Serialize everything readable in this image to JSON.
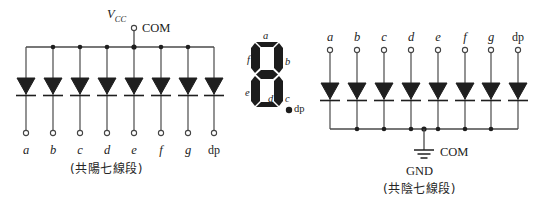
{
  "figure": {
    "background": "#ffffff",
    "ink_color": "#1c1c1c",
    "line_color": "#404040"
  },
  "common_anode_circuit": {
    "name": "common-anode-seven-segment",
    "supply_label": "V",
    "supply_subscript": "CC",
    "common_terminal_label": "COM",
    "caption": "(共陽七線段)",
    "terminals": [
      {
        "label": "a",
        "italic": true
      },
      {
        "label": "b",
        "italic": true
      },
      {
        "label": "c",
        "italic": true
      },
      {
        "label": "d",
        "italic": true
      },
      {
        "label": "e",
        "italic": true
      },
      {
        "label": "f",
        "italic": true
      },
      {
        "label": "g",
        "italic": true
      },
      {
        "label": "dp",
        "italic": false
      }
    ],
    "diode_count": 8,
    "diode_orientation": "cathode-down"
  },
  "seven_segment_display": {
    "name": "seven-segment-display-glyph",
    "segment_labels": [
      {
        "id": "a",
        "label": "a"
      },
      {
        "id": "b",
        "label": "b"
      },
      {
        "id": "c",
        "label": "c"
      },
      {
        "id": "d",
        "label": "d"
      },
      {
        "id": "e",
        "label": "e"
      },
      {
        "id": "f",
        "label": "f"
      },
      {
        "id": "g",
        "label": "g"
      }
    ],
    "decimal_point_label": "dp",
    "glyph_shown": "8"
  },
  "common_cathode_circuit": {
    "name": "common-cathode-seven-segment",
    "ground_label": "GND",
    "common_terminal_label": "COM",
    "caption": "(共陰七線段)",
    "terminals": [
      {
        "label": "a",
        "italic": true
      },
      {
        "label": "b",
        "italic": true
      },
      {
        "label": "c",
        "italic": true
      },
      {
        "label": "d",
        "italic": true
      },
      {
        "label": "e",
        "italic": true
      },
      {
        "label": "f",
        "italic": true
      },
      {
        "label": "g",
        "italic": true
      },
      {
        "label": "dp",
        "italic": false
      }
    ],
    "diode_count": 8,
    "diode_orientation": "cathode-down"
  }
}
